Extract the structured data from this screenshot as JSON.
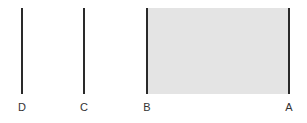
{
  "diagram": {
    "shaded_region": {
      "from": "B",
      "to": "A",
      "color": "#e4e4e4"
    },
    "line_color": "#2a2a2a",
    "lines": [
      {
        "label": "D",
        "x": 22
      },
      {
        "label": "C",
        "x": 84
      },
      {
        "label": "B",
        "x": 147
      },
      {
        "label": "A",
        "x": 289
      }
    ]
  }
}
